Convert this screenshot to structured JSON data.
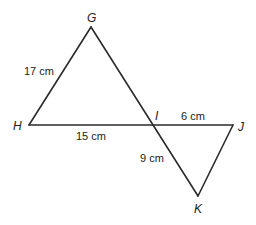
{
  "diagram": {
    "vertices": {
      "G": {
        "label": "G"
      },
      "H": {
        "label": "H"
      },
      "I": {
        "label": "I"
      },
      "J": {
        "label": "J"
      },
      "K": {
        "label": "K"
      }
    },
    "measurements": {
      "GH": "17 cm",
      "HI": "15 cm",
      "IJ": "6 cm",
      "IK": "9 cm"
    },
    "segments": [
      "GH",
      "HJ",
      "GK",
      "JK"
    ],
    "line_color": "#2b2b2b"
  }
}
